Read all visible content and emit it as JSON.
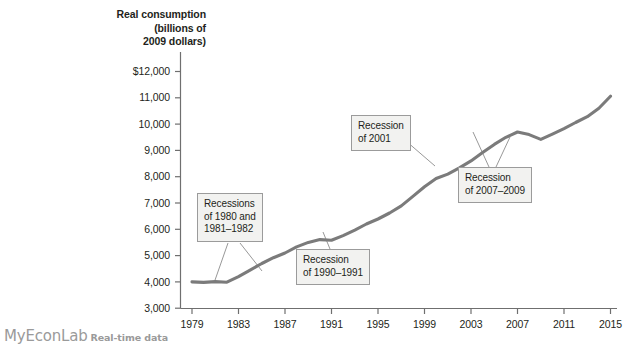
{
  "brand": {
    "name": "MyEconLab",
    "subtitle": "Real-time data"
  },
  "chart_data": {
    "type": "line",
    "title": "",
    "ylabel_lines": [
      "Real consumption",
      "(billions of",
      "2009 dollars)"
    ],
    "xlabel": "",
    "ylabel": "Real consumption (billions of 2009 dollars)",
    "xlim": [
      1979,
      2016
    ],
    "ylim": [
      3000,
      12000
    ],
    "grid": false,
    "legend": "none",
    "line_color": "#7b7b7b",
    "ytick_labels": [
      "$12,000",
      "11,000",
      "10,000",
      "9,000",
      "8,000",
      "7,000",
      "6,000",
      "5,000",
      "4,000",
      "3,000"
    ],
    "yticks": [
      12000,
      11000,
      10000,
      9000,
      8000,
      7000,
      6000,
      5000,
      4000,
      3000
    ],
    "xtick_labels": [
      "1979",
      "1983",
      "1987",
      "1991",
      "1995",
      "1999",
      "2003",
      "2007",
      "2011",
      "2015"
    ],
    "xticks": [
      1979,
      1983,
      1987,
      1991,
      1995,
      1999,
      2003,
      2007,
      2011,
      2015
    ],
    "x": [
      1979,
      1980,
      1981,
      1982,
      1983,
      1984,
      1985,
      1986,
      1987,
      1988,
      1989,
      1990,
      1991,
      1992,
      1993,
      1994,
      1995,
      1996,
      1997,
      1998,
      1999,
      2000,
      2001,
      2002,
      2003,
      2004,
      2005,
      2006,
      2007,
      2008,
      2009,
      2010,
      2011,
      2012,
      2013,
      2014,
      2015
    ],
    "values": [
      4000,
      3980,
      4010,
      3990,
      4200,
      4450,
      4700,
      4920,
      5100,
      5330,
      5500,
      5610,
      5580,
      5760,
      5970,
      6200,
      6390,
      6620,
      6890,
      7250,
      7620,
      7930,
      8100,
      8340,
      8600,
      8920,
      9230,
      9500,
      9700,
      9600,
      9420,
      9620,
      9830,
      10060,
      10280,
      10600,
      11060
    ],
    "annotations": [
      {
        "id": "recessions-1980-1981-1982",
        "lines": [
          "Recessions",
          "of 1980 and",
          "1981–1982"
        ]
      },
      {
        "id": "recession-1990-1991",
        "lines": [
          "Recession",
          "of 1990–1991"
        ]
      },
      {
        "id": "recession-2001",
        "lines": [
          "Recession",
          "of 2001"
        ]
      },
      {
        "id": "recession-2007-2009",
        "lines": [
          "Recession",
          "of 2007–2009"
        ]
      }
    ]
  }
}
